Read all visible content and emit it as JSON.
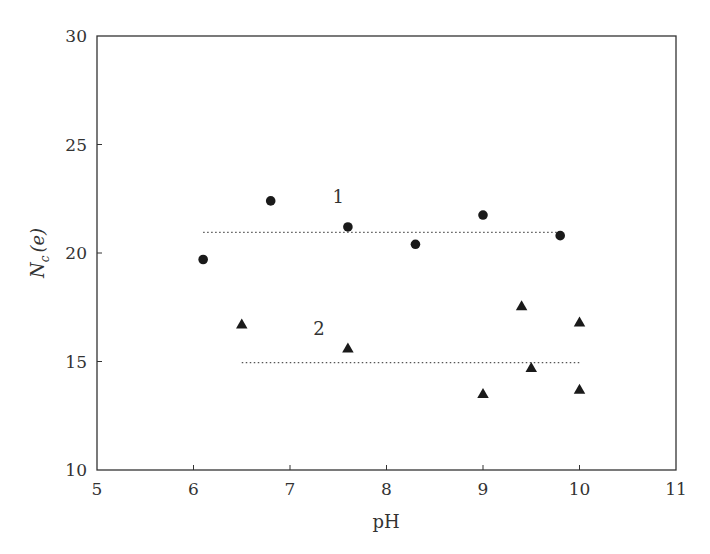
{
  "chart_data": {
    "type": "scatter",
    "title": "",
    "xlabel": "pH",
    "ylabel": "N_c (e)",
    "ylabel_main": "N",
    "ylabel_sub": "c",
    "ylabel_tail": "(e)",
    "xlim": [
      5,
      11
    ],
    "ylim": [
      10,
      30
    ],
    "xticks": [
      5,
      6,
      7,
      8,
      9,
      10,
      11
    ],
    "yticks": [
      10,
      15,
      20,
      25,
      30
    ],
    "grid": false,
    "legend": "none",
    "series": [
      {
        "name": "1",
        "marker": "circle",
        "color": "#1a1a1a",
        "points": [
          {
            "x": 6.1,
            "y": 19.7
          },
          {
            "x": 6.8,
            "y": 22.4
          },
          {
            "x": 7.6,
            "y": 21.2
          },
          {
            "x": 8.3,
            "y": 20.4
          },
          {
            "x": 9.0,
            "y": 21.75
          },
          {
            "x": 9.8,
            "y": 20.8
          }
        ],
        "mean_line": {
          "y": 20.95,
          "x_start": 6.1,
          "x_end": 9.8,
          "style": "dotted"
        },
        "label_position": {
          "x": 7.5,
          "y": 22.6
        }
      },
      {
        "name": "2",
        "marker": "triangle",
        "color": "#1a1a1a",
        "points": [
          {
            "x": 6.5,
            "y": 16.7
          },
          {
            "x": 7.6,
            "y": 15.6
          },
          {
            "x": 9.0,
            "y": 13.5
          },
          {
            "x": 9.4,
            "y": 17.55
          },
          {
            "x": 9.5,
            "y": 14.7
          },
          {
            "x": 10.0,
            "y": 16.8
          },
          {
            "x": 10.0,
            "y": 13.7
          }
        ],
        "mean_line": {
          "y": 14.95,
          "x_start": 6.5,
          "x_end": 10.0,
          "style": "dotted"
        },
        "label_position": {
          "x": 7.3,
          "y": 16.5
        }
      }
    ],
    "annotations": [
      "1",
      "2"
    ]
  },
  "colors": {
    "axis": "#333333",
    "marker": "#1a1a1a",
    "dotted_line": "#555555"
  }
}
